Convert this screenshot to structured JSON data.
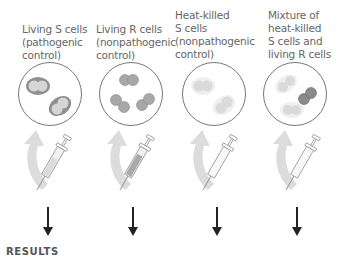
{
  "columns": [
    {
      "id": "living-s",
      "label": "Living S cells\n(pathogenic\ncontrol)",
      "cell_type": "S-living"
    },
    {
      "id": "living-r",
      "label": "Living R cells\n(nonpathogenic\ncontrol)",
      "cell_type": "R-living"
    },
    {
      "id": "heat-killed-s",
      "label": "Heat-killed\nS cells\n(nonpathogenic\ncontrol)",
      "cell_type": "S-dead"
    },
    {
      "id": "mixture",
      "label": "Mixture of\nheat-killed\nS cells and\nliving R cells",
      "cell_type": "mixture"
    }
  ],
  "results_heading": "RESULTS",
  "colors": {
    "dish_border": "#777777",
    "capsule_living": "#8a8a8a",
    "capsule_dead": "#e6e6e6",
    "cell_living": "#b5b5b5",
    "cell_dead": "#dcdcdc",
    "r_cell": "#a8a8a8",
    "curved_arrow": "#d9d9d9",
    "down_arrow": "#222222"
  }
}
